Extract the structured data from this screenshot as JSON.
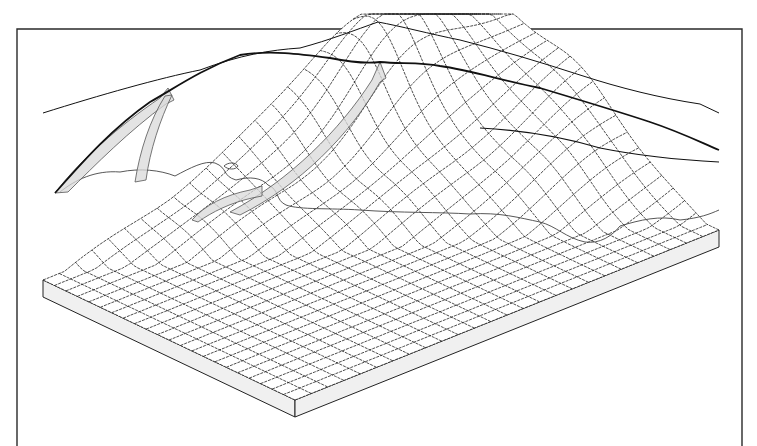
{
  "figure": {
    "title": "",
    "frame": {
      "x": 17,
      "y": 29,
      "right": 742,
      "stroke": "#2a2a2a"
    },
    "block": {
      "back_left": [
        43,
        113
      ],
      "front_left_top": [
        43,
        280
      ],
      "front_corner_top": [
        295,
        400
      ],
      "front_corner_bottom": [
        295,
        417
      ],
      "front_right_top": [
        719,
        230
      ],
      "back_right": [
        719,
        113
      ],
      "thickness": 17,
      "side_color": "#f0f0f0"
    },
    "grid": {
      "columns": 26,
      "rows": 22,
      "line_color": "#1e1e1e"
    },
    "terrain": {
      "peak": [
        378,
        22
      ],
      "fill_color": "#ececec",
      "ridge_color": "#111111"
    },
    "features": [
      {
        "name": "main-ridge",
        "type": "ridge-line"
      },
      {
        "name": "secondary-ridge",
        "type": "ridge-line"
      },
      {
        "name": "flow-arrow-left",
        "type": "flow-path"
      },
      {
        "name": "flow-arrow-center",
        "type": "flow-path"
      },
      {
        "name": "flow-arrow-right",
        "type": "flow-path"
      },
      {
        "name": "coastline",
        "type": "boundary"
      }
    ]
  }
}
